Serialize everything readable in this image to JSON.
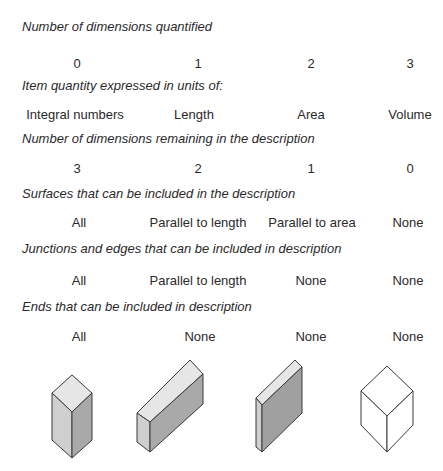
{
  "rows": [
    {
      "heading": "Number of dimensions quantified",
      "values": [
        "0",
        "1",
        "2",
        "3"
      ]
    },
    {
      "heading": "Item quantity expressed in units of:",
      "values": [
        "Integral numbers",
        "Length",
        "Area",
        "Volume"
      ]
    },
    {
      "heading": "Number of dimensions remaining in the description",
      "values": [
        "3",
        "2",
        "1",
        "0"
      ]
    },
    {
      "heading": "Surfaces that can be included in the description",
      "values": [
        "All",
        "Parallel to length",
        "Parallel to area",
        "None"
      ]
    },
    {
      "heading": "Junctions and edges that can be included in description",
      "values": [
        "All",
        "Parallel to length",
        "None",
        "None"
      ]
    },
    {
      "heading": "Ends that can be included in description",
      "values": [
        "All",
        "None",
        "None",
        "None"
      ]
    }
  ],
  "shapes": [
    {
      "name": "column-shape",
      "dimensions": 0
    },
    {
      "name": "bar-shape",
      "dimensions": 1
    },
    {
      "name": "slab-shape",
      "dimensions": 2
    },
    {
      "name": "cube-outline-shape",
      "dimensions": 3
    }
  ],
  "colors": {
    "text": "#2a2a2a",
    "top_face": "#e6e6e6",
    "left_face": "#cfcfcf",
    "right_face": "#a9a9a9",
    "outline": "#3a3a3a"
  }
}
